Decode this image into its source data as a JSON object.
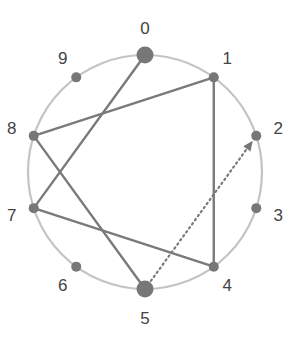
{
  "diagram": {
    "type": "circular-graph",
    "node_count": 10,
    "nodes": [
      {
        "id": 0,
        "label": "0",
        "emphasized": true
      },
      {
        "id": 1,
        "label": "1",
        "emphasized": false
      },
      {
        "id": 2,
        "label": "2",
        "emphasized": false
      },
      {
        "id": 3,
        "label": "3",
        "emphasized": false
      },
      {
        "id": 4,
        "label": "4",
        "emphasized": false
      },
      {
        "id": 5,
        "label": "5",
        "emphasized": true
      },
      {
        "id": 6,
        "label": "6",
        "emphasized": false
      },
      {
        "id": 7,
        "label": "7",
        "emphasized": false
      },
      {
        "id": 8,
        "label": "8",
        "emphasized": false
      },
      {
        "id": 9,
        "label": "9",
        "emphasized": false
      }
    ],
    "edges": [
      {
        "from": 0,
        "to": 7,
        "style": "solid"
      },
      {
        "from": 7,
        "to": 4,
        "style": "solid"
      },
      {
        "from": 4,
        "to": 1,
        "style": "solid"
      },
      {
        "from": 1,
        "to": 8,
        "style": "solid"
      },
      {
        "from": 8,
        "to": 5,
        "style": "solid"
      },
      {
        "from": 5,
        "to": 2,
        "style": "dotted",
        "arrow": true
      }
    ],
    "colors": {
      "ring": "#c4c4c4",
      "edge": "#7a7a7a",
      "node": "#777777",
      "label": "#444444"
    }
  }
}
